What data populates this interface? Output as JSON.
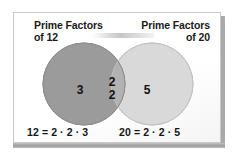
{
  "figure": {
    "kind": "venn-diagram",
    "title_left": {
      "line1": "Prime Factors",
      "line2": "of 12"
    },
    "title_right": {
      "line1": "Prime Factors",
      "line2": "of 20"
    },
    "sets": [
      {
        "id": "left",
        "label": "Prime Factors of 12",
        "number_of": 12,
        "fill": "#9b9b9b",
        "stroke": "#8a8a8a",
        "exclusive_elements": [
          "3"
        ]
      },
      {
        "id": "right",
        "label": "Prime Factors of 20",
        "number_of": 20,
        "fill": "#d9d9d9",
        "stroke": "#c4c4c4",
        "exclusive_elements": [
          "5"
        ]
      }
    ],
    "intersection": {
      "label": "common prime factors",
      "fill": "#b2b2b2",
      "elements": [
        "2",
        "2"
      ]
    },
    "regions": {
      "left_only_text": "3",
      "intersection_text_1": "2",
      "intersection_text_2": "2",
      "right_only_text": "5"
    },
    "equations": {
      "left": "12 = 2 · 2 · 3",
      "right": "20 = 2 · 2 · 5"
    },
    "colors": {
      "card_background": "#fdfdfd",
      "card_border": "#c9c9c9",
      "text": "#1a1a1a",
      "shadow": "#a9a9a9"
    }
  }
}
